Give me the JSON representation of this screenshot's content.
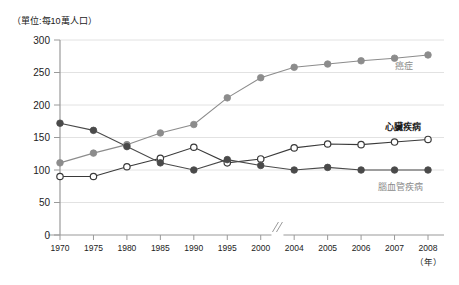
{
  "unit_note": "（單位:每10萬人口）",
  "axis": {
    "x_unit": "（年）",
    "y_ticks": [
      "0",
      "50",
      "100",
      "150",
      "200",
      "250",
      "300"
    ],
    "x_ticks": [
      "1970",
      "1975",
      "1980",
      "1985",
      "1990",
      "1995",
      "2000",
      "2004",
      "2005",
      "2006",
      "2007",
      "2008"
    ],
    "break_marker": "//"
  },
  "labels": {
    "cancer": "癌症",
    "heart": "心臟疾病",
    "cerebro": "腦血管疾病"
  },
  "colors": {
    "cancer": "#8c8c8c",
    "heart": "#3a3a3a",
    "cerebro": "#4a4a4a",
    "grid": "#e2e2e2",
    "axis": "#9a9a9a",
    "text": "#222222",
    "gray_label": "#8c8c8c"
  },
  "chart_data": {
    "type": "line",
    "title": "",
    "subtitle": "",
    "xlabel": "（年）",
    "ylabel": "（單位:每10萬人口）",
    "categories": [
      "1970",
      "1975",
      "1980",
      "1985",
      "1990",
      "1995",
      "2000",
      "2004",
      "2005",
      "2006",
      "2007",
      "2008"
    ],
    "ylim": [
      0,
      300
    ],
    "ytick_step": 50,
    "grid": true,
    "legend_position": "inline-right",
    "axis_break_between": [
      "2000",
      "2004"
    ],
    "series": [
      {
        "name": "癌症",
        "marker": "filled-circle",
        "color": "#8c8c8c",
        "values": [
          111,
          126,
          139,
          157,
          170,
          211,
          242,
          258,
          263,
          268,
          272,
          277
        ]
      },
      {
        "name": "心臟疾病",
        "marker": "open-circle",
        "color": "#3a3a3a",
        "values": [
          90,
          90,
          105,
          118,
          135,
          111,
          117,
          134,
          140,
          139,
          143,
          147
        ]
      },
      {
        "name": "腦血管疾病",
        "marker": "filled-circle",
        "color": "#4a4a4a",
        "values": [
          172,
          161,
          136,
          111,
          100,
          116,
          107,
          100,
          104,
          100,
          100,
          100
        ]
      }
    ]
  }
}
